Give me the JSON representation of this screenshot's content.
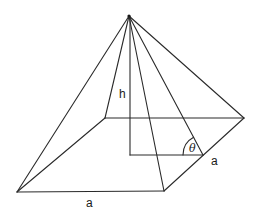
{
  "diagram": {
    "type": "square-pyramid",
    "labels": {
      "height": "h",
      "base_side_front": "a",
      "base_side_right": "a",
      "angle": "θ"
    },
    "points": {
      "apex": [
        129,
        16
      ],
      "front_left": [
        17,
        192
      ],
      "front_right": [
        164,
        191
      ],
      "back_right": [
        244,
        118
      ],
      "back_left": [
        105,
        118
      ],
      "height_foot": [
        130,
        155
      ],
      "right_edge_mid": [
        203,
        155
      ]
    },
    "colors": {
      "line": "#2a2a2a",
      "background": "#ffffff"
    }
  }
}
